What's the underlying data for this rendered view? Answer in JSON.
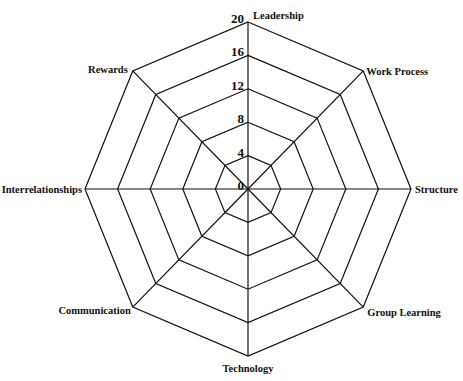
{
  "chart_data": {
    "type": "radar",
    "title": "",
    "categories": [
      "Leadership",
      "Work Process",
      "Structure",
      "Group Learning",
      "Technology",
      "Communication",
      "Interrelationships",
      "Rewards"
    ],
    "series": [],
    "radial_ticks": [
      0,
      4,
      8,
      12,
      16,
      20
    ],
    "rlim": [
      0,
      20
    ],
    "grid": true,
    "grid_shape": "octagon",
    "legend": null
  },
  "colors": {
    "grid": "#111111",
    "background": "#ffffff",
    "text": "#111111"
  }
}
